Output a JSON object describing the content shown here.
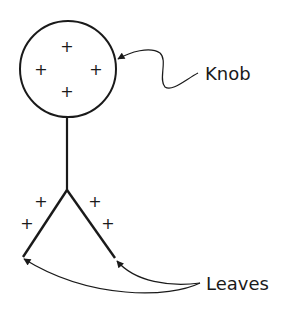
{
  "diagram": {
    "type": "labeled-schematic",
    "labels": {
      "knob": "Knob",
      "leaves": "Leaves"
    },
    "knob": {
      "shape": "circle",
      "charge_symbols": [
        "+",
        "+",
        "+",
        "+"
      ]
    },
    "leaves": {
      "shape": "inverted-V",
      "charge_symbols": [
        "+",
        "+",
        "+",
        "+"
      ]
    },
    "colors": {
      "stroke": "#1a1a1a",
      "background": "#ffffff"
    }
  }
}
